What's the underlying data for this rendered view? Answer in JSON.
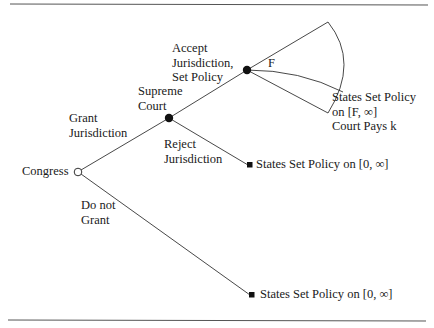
{
  "diagram": {
    "type": "game-tree",
    "colors": {
      "line": "#333333",
      "text": "#1a1a1a",
      "rule": "#555555"
    },
    "nodes": {
      "congress": {
        "label": "Congress",
        "style": "open-circle"
      },
      "supreme_court": {
        "label": "Supreme\nCourt",
        "style": "filled-circle"
      },
      "accept_node": {
        "style": "filled-circle"
      }
    },
    "edges": {
      "grant": {
        "label": "Grant\nJurisdiction"
      },
      "do_not_grant": {
        "label": "Do not\nGrant"
      },
      "accept": {
        "label": "Accept\nJurisdiction,\nSet Policy"
      },
      "reject": {
        "label": "Reject\nJurisdiction"
      }
    },
    "fan": {
      "label": "F"
    },
    "outcomes": {
      "accept": {
        "label": "States Set Policy\non [F, ∞]\nCourt Pays k"
      },
      "reject": {
        "label": "States Set Policy on [0, ∞]"
      },
      "do_not_grant": {
        "label": "States Set Policy on [0, ∞]"
      }
    }
  }
}
